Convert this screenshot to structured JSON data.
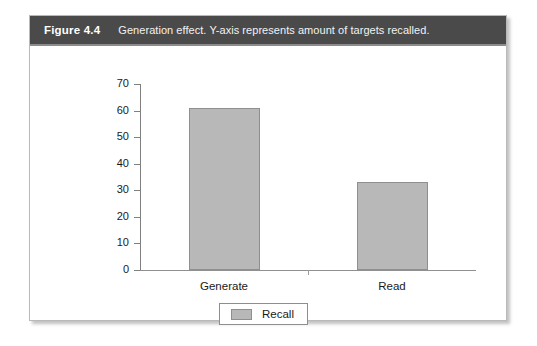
{
  "figure": {
    "number_label": "Figure 4.4",
    "caption": "Generation effect. Y-axis represents amount of targets recalled.",
    "header_bg": "#4a4a4a",
    "panel_border": "#b9b9b9"
  },
  "chart_data": {
    "type": "bar",
    "title": "",
    "subtitle": "",
    "categories": [
      "Generate",
      "Read"
    ],
    "values": [
      61,
      33
    ],
    "series": [
      {
        "name": "Recall",
        "values": [
          61,
          33
        ],
        "color": "#b8b8b8"
      }
    ],
    "xlabel": "",
    "ylabel": "",
    "ylim": [
      0,
      70
    ],
    "yticks": [
      0,
      10,
      20,
      30,
      40,
      50,
      60,
      70
    ],
    "ytick_labels": [
      "0",
      "10",
      "20",
      "30",
      "40",
      "50",
      "60",
      "70"
    ],
    "grid": false,
    "legend": {
      "position": "bottom-center",
      "entries": [
        {
          "label": "Recall",
          "color": "#b8b8b8"
        }
      ]
    },
    "bar_edge_color": "#8f8f8f",
    "axis_color": "#808080"
  }
}
